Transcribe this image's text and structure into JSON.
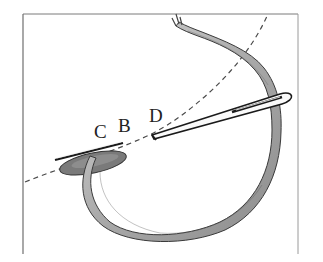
{
  "diagram": {
    "labels": {
      "c": "C",
      "b": "B",
      "d": "D"
    },
    "elements": [
      "frame",
      "fabric-curve-dashed",
      "needle",
      "thread",
      "stitch-petal"
    ],
    "colors": {
      "frame": "#6f6f6f",
      "dashed_line": "#4a4a4a",
      "thread_fill": "#b9b9b9",
      "thread_outline": "#3a3a3a",
      "stitch_fill": "#7a7a7a",
      "needle": "#1a1a1a"
    }
  }
}
